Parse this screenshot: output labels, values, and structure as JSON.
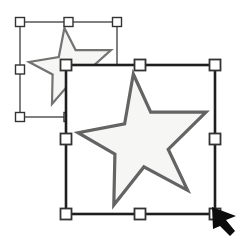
{
  "canvas": {
    "width": 246,
    "height": 251,
    "background": "#ffffff"
  },
  "colors": {
    "star_fill": "#f6f6f4",
    "small_star_stroke": "#737373",
    "large_star_stroke": "#646464",
    "small_selection_stroke": "#4a4a4a",
    "large_selection_stroke": "#1e1e1e",
    "handle_fill": "#ffffff",
    "handle_border": "#333333",
    "cursor_fill": "#0c0c0c"
  },
  "star_shape_norm": [
    [
      0.432,
      0.0
    ],
    [
      0.568,
      0.291
    ],
    [
      1.0,
      0.291
    ],
    [
      0.705,
      0.575
    ],
    [
      0.856,
      0.888
    ],
    [
      0.515,
      0.709
    ],
    [
      0.28,
      1.0
    ],
    [
      0.288,
      0.612
    ],
    [
      0.0,
      0.448
    ],
    [
      0.364,
      0.381
    ]
  ],
  "small_star": {
    "origin": [
      29,
      28
    ],
    "size": [
      82,
      76
    ],
    "stroke_width": 2.2
  },
  "large_star": {
    "origin": [
      78,
      74
    ],
    "size": [
      128,
      131
    ],
    "stroke_width": 3.2
  },
  "small_selection": {
    "box": [
      20,
      22,
      97,
      95
    ],
    "stroke_width": 1.4,
    "handle_size": 9,
    "handle_border_width": 1.4,
    "handles": [
      {
        "pos": "nw",
        "x": 20,
        "y": 22
      },
      {
        "pos": "n",
        "x": 68.5,
        "y": 22
      },
      {
        "pos": "ne",
        "x": 117,
        "y": 22
      },
      {
        "pos": "w",
        "x": 20,
        "y": 69.5
      },
      {
        "pos": "e",
        "x": 117,
        "y": 69.5
      },
      {
        "pos": "sw",
        "x": 20,
        "y": 117
      },
      {
        "pos": "s",
        "x": 68.5,
        "y": 117
      },
      {
        "pos": "se",
        "x": 117,
        "y": 117
      }
    ]
  },
  "large_selection": {
    "box": [
      66,
      65,
      149,
      149
    ],
    "stroke_width": 2.6,
    "handle_size": 11,
    "handle_border_width": 1.8,
    "handles": [
      {
        "pos": "nw",
        "x": 66,
        "y": 65
      },
      {
        "pos": "n",
        "x": 140,
        "y": 65
      },
      {
        "pos": "ne",
        "x": 215,
        "y": 65
      },
      {
        "pos": "w",
        "x": 66,
        "y": 139
      },
      {
        "pos": "e",
        "x": 215,
        "y": 139
      },
      {
        "pos": "sw",
        "x": 66,
        "y": 214
      },
      {
        "pos": "s",
        "x": 140,
        "y": 214
      },
      {
        "pos": "se",
        "x": 215,
        "y": 214
      }
    ]
  },
  "cursor": {
    "points": [
      [
        212,
        207
      ],
      [
        236,
        216
      ],
      [
        226,
        220
      ],
      [
        235,
        231
      ],
      [
        230,
        236
      ],
      [
        220,
        226
      ],
      [
        213,
        229
      ]
    ]
  }
}
